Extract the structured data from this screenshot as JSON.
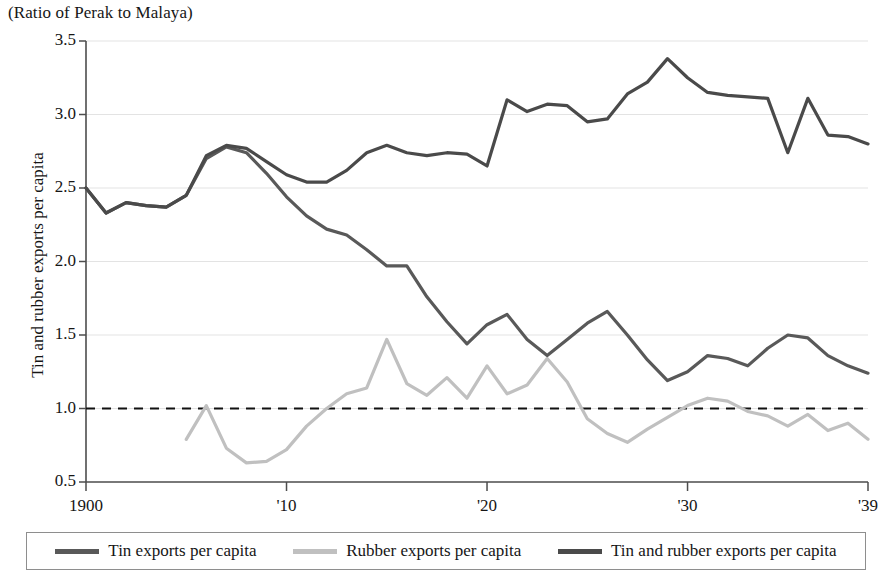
{
  "subtitle": "(Ratio of Perak to Malaya)",
  "axes": {
    "ylabel": "Tin and rubber exports per capita",
    "yticks": [
      "0.5",
      "1.0",
      "1.5",
      "2.0",
      "2.5",
      "3.0",
      "3.5"
    ],
    "xticks": [
      {
        "label": "1900",
        "year": 1900
      },
      {
        "label": "'10",
        "year": 1910
      },
      {
        "label": "'20",
        "year": 1920
      },
      {
        "label": "'30",
        "year": 1930
      },
      {
        "label": "'39",
        "year": 1939
      }
    ],
    "reference_line_value": 1.0
  },
  "legend": [
    {
      "label": "Tin exports per capita",
      "color": "#595959"
    },
    {
      "label": "Rubber exports per capita",
      "color": "#c0c0c0"
    },
    {
      "label": "Tin and rubber exports per capita",
      "color": "#4a4a4a"
    }
  ],
  "colors": {
    "tin": "#595959",
    "rubber": "#c0c0c0",
    "combined": "#4a4a4a",
    "gridline": "#e3e3e3",
    "axis": "#4d4d4d",
    "reference_line": "#111111"
  },
  "chart_data": {
    "type": "line",
    "title": "",
    "subtitle": "(Ratio of Perak to Malaya)",
    "xlabel": "",
    "ylabel": "Tin and rubber exports per capita",
    "xlim": [
      1900,
      1939
    ],
    "ylim": [
      0.5,
      3.5
    ],
    "ytick_values": [
      0.5,
      1.0,
      1.5,
      2.0,
      2.5,
      3.0,
      3.5
    ],
    "xtick_values": [
      1900,
      1910,
      1920,
      1930,
      1939
    ],
    "grid": "horizontal",
    "legend_position": "bottom",
    "annotations": [
      {
        "type": "hline",
        "y": 1.0,
        "style": "dashed",
        "label": "parity (ratio = 1.0)"
      }
    ],
    "x": [
      1900,
      1901,
      1902,
      1903,
      1904,
      1905,
      1906,
      1907,
      1908,
      1909,
      1910,
      1911,
      1912,
      1913,
      1914,
      1915,
      1916,
      1917,
      1918,
      1919,
      1920,
      1921,
      1922,
      1923,
      1924,
      1925,
      1926,
      1927,
      1928,
      1929,
      1930,
      1931,
      1932,
      1933,
      1934,
      1935,
      1936,
      1937,
      1938,
      1939
    ],
    "series": [
      {
        "name": "Tin exports per capita",
        "color": "#595959",
        "values": [
          2.5,
          2.33,
          2.4,
          2.38,
          2.37,
          2.45,
          2.7,
          2.78,
          2.74,
          2.6,
          2.44,
          2.31,
          2.22,
          2.18,
          2.08,
          1.97,
          1.97,
          1.76,
          1.59,
          1.44,
          1.57,
          1.64,
          1.47,
          1.36,
          1.47,
          1.58,
          1.66,
          1.5,
          1.33,
          1.19,
          1.25,
          1.36,
          1.34,
          1.29,
          1.41,
          1.5,
          1.48,
          1.36,
          1.29,
          1.24
        ]
      },
      {
        "name": "Rubber exports per capita",
        "color": "#c0c0c0",
        "values": [
          null,
          null,
          null,
          null,
          null,
          0.79,
          1.02,
          0.73,
          0.63,
          0.64,
          0.72,
          0.88,
          1.0,
          1.1,
          1.14,
          1.47,
          1.17,
          1.09,
          1.21,
          1.07,
          1.29,
          1.1,
          1.16,
          1.34,
          1.18,
          0.93,
          0.83,
          0.77,
          0.86,
          0.94,
          1.02,
          1.07,
          1.05,
          0.98,
          0.95,
          0.88,
          0.96,
          0.85,
          0.9,
          0.79
        ]
      },
      {
        "name": "Tin and rubber exports per capita",
        "color": "#4a4a4a",
        "values": [
          2.5,
          2.33,
          2.4,
          2.38,
          2.37,
          2.45,
          2.72,
          2.79,
          2.77,
          2.68,
          2.59,
          2.54,
          2.54,
          2.62,
          2.74,
          2.79,
          2.74,
          2.72,
          2.74,
          2.73,
          2.65,
          3.1,
          3.02,
          3.07,
          3.06,
          2.95,
          2.97,
          3.14,
          3.22,
          3.38,
          3.25,
          3.15,
          3.13,
          3.12,
          3.11,
          2.74,
          3.11,
          2.86,
          2.85,
          2.8
        ]
      }
    ]
  }
}
